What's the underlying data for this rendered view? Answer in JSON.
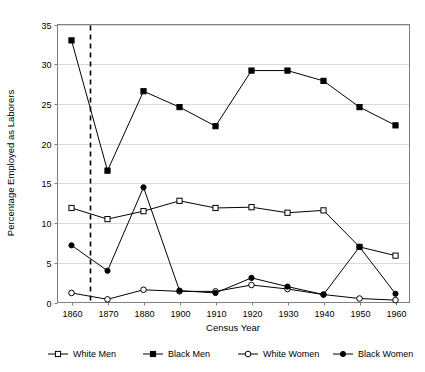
{
  "chart_data": {
    "type": "line",
    "title": "",
    "xlabel": "Census Year",
    "ylabel": "Percentage Employed as Laborers",
    "x": [
      1860,
      1870,
      1880,
      1900,
      1910,
      1920,
      1930,
      1940,
      1950,
      1960
    ],
    "categories": [
      "1860",
      "1870",
      "1880",
      "1900",
      "1910",
      "1920",
      "1930",
      "1940",
      "1950",
      "1960"
    ],
    "xlim": [
      1855,
      1965
    ],
    "ylim": [
      0,
      35
    ],
    "yticks": [
      0,
      5,
      10,
      15,
      20,
      25,
      30,
      35
    ],
    "ytick_labels": [
      "0",
      "5",
      "10",
      "15",
      "20",
      "25",
      "30",
      "35"
    ],
    "grid": "horizontal",
    "legend_position": "bottom",
    "series": [
      {
        "name": "White Men",
        "marker": "open-square",
        "values": [
          11.9,
          10.5,
          11.5,
          12.8,
          11.9,
          12.0,
          11.3,
          11.6,
          7.0,
          5.9
        ]
      },
      {
        "name": "Black Men",
        "marker": "filled-square",
        "values": [
          33.0,
          16.6,
          26.6,
          24.6,
          22.2,
          29.2,
          29.2,
          27.9,
          24.6,
          22.3
        ]
      },
      {
        "name": "White Women",
        "marker": "open-circle",
        "values": [
          1.2,
          0.4,
          1.6,
          1.4,
          1.4,
          2.2,
          1.7,
          1.0,
          0.5,
          0.3
        ]
      },
      {
        "name": "Black Women",
        "marker": "filled-circle",
        "values": [
          7.2,
          4.0,
          14.5,
          1.5,
          1.2,
          3.1,
          2.0,
          1.0,
          7.0,
          1.1
        ]
      }
    ],
    "annotations": [
      {
        "name": "emancipation-marker",
        "type": "vertical-dashed-line",
        "x": 1865,
        "label": ""
      }
    ]
  },
  "legend": {
    "items": [
      {
        "label": "White Men",
        "marker": "open-square"
      },
      {
        "label": "Black Men",
        "marker": "filled-square"
      },
      {
        "label": "White Women",
        "marker": "open-circle"
      },
      {
        "label": "Black Women",
        "marker": "filled-circle"
      }
    ]
  },
  "colors": {
    "line": "#000000",
    "grid": "#d9d9d9",
    "frame": "#808080",
    "background": "#ffffff"
  }
}
